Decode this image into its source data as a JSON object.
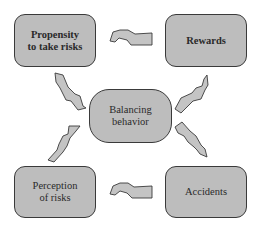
{
  "diagram": {
    "type": "cycle",
    "colors": {
      "box_fill": "#bdbdbd",
      "box_border": "#3a3a3a",
      "arrow_fill": "#c4c4c4",
      "text": "#2a2a2a"
    },
    "nodes": {
      "propensity": {
        "line1": "Propensity",
        "line2": "to take risks"
      },
      "rewards": {
        "line1": "Rewards"
      },
      "balancing": {
        "line1": "Balancing",
        "line2": "behavior"
      },
      "perception": {
        "line1": "Perception",
        "line2": "of risks"
      },
      "accidents": {
        "line1": "Accidents"
      }
    },
    "edges": [
      {
        "from": "Rewards",
        "to": "Propensity to take risks"
      },
      {
        "from": "Propensity to take risks",
        "to": "Balancing behavior"
      },
      {
        "from": "Balancing behavior",
        "to": "Rewards"
      },
      {
        "from": "Balancing behavior",
        "to": "Accidents"
      },
      {
        "from": "Accidents",
        "to": "Perception of risks"
      },
      {
        "from": "Perception of risks",
        "to": "Balancing behavior"
      }
    ]
  }
}
